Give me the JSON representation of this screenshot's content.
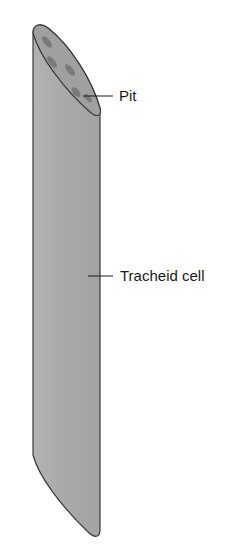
{
  "diagram": {
    "colors": {
      "cell_fill": "#ababab",
      "cell_top_face": "#a4a4a4",
      "pit_fill": "#7f7f7f",
      "outline": "#3a3a3a",
      "leader_line": "#1a1a1a"
    },
    "labels": [
      {
        "id": "pit",
        "text": "Pit"
      },
      {
        "id": "tracheid",
        "text": "Tracheid cell"
      }
    ]
  }
}
